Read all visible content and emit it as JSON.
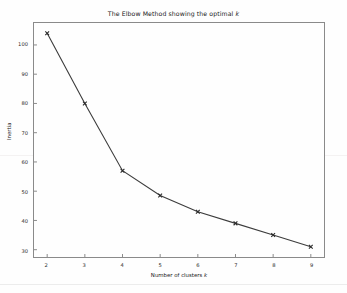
{
  "chart_data": {
    "type": "line",
    "title": "The Elbow Method showing the optimal k",
    "title_plain": "The Elbow Method showing the optimal ",
    "title_italic": "k",
    "xlabel": "Number of clusters k",
    "xlabel_plain": "Number of clusters ",
    "xlabel_italic": "k",
    "ylabel": "Inertia",
    "x": [
      2,
      3,
      4,
      5,
      6,
      7,
      8,
      9
    ],
    "values": [
      104,
      80,
      57,
      48.5,
      43,
      39,
      35,
      31
    ],
    "xticks": [
      "2",
      "3",
      "4",
      "5",
      "6",
      "7",
      "8",
      "9"
    ],
    "yticks": [
      "30",
      "40",
      "50",
      "60",
      "70",
      "80",
      "90",
      "100"
    ],
    "ytick_values": [
      30,
      40,
      50,
      60,
      70,
      80,
      90,
      100
    ],
    "xlim": [
      1.65,
      9.35
    ],
    "ylim": [
      27.5,
      107.5
    ],
    "grid": false,
    "legend": null,
    "marker": "x",
    "line_color": "#3c3c3c",
    "marker_color": "#2a2a2a",
    "frame_color": "#8a8a8a",
    "background_color": "#fefefe"
  }
}
